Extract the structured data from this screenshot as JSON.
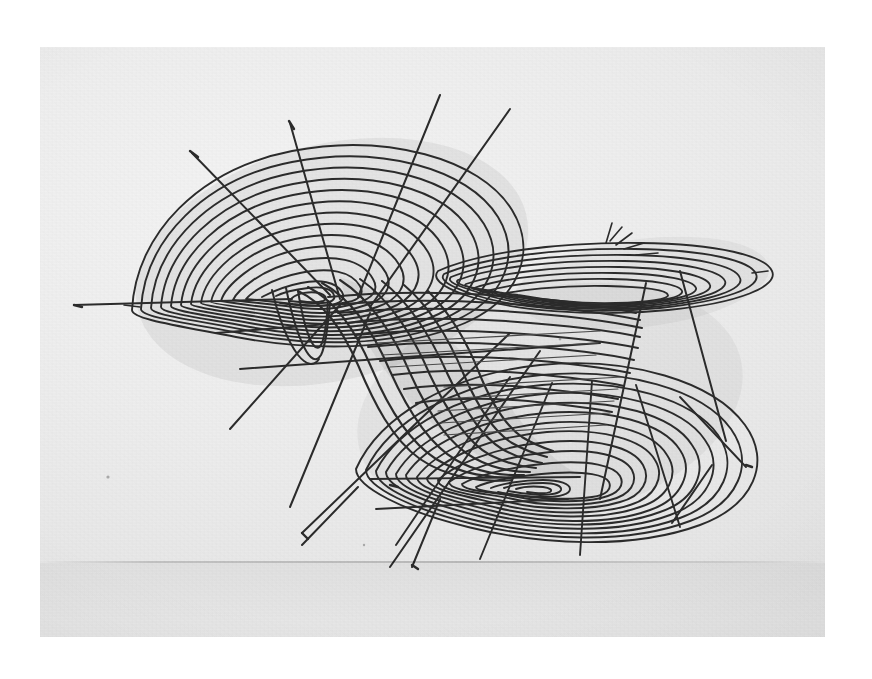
{
  "photo": {
    "background_color": "#ffffff",
    "paper_color": "#ededed",
    "ink_color": "#2b2b2b",
    "paper_rect": {
      "x": 40,
      "y": 47,
      "width": 785,
      "height": 590
    },
    "subject": "hand-drawn wireframe of a folded two-lobed surface",
    "caption": ""
  },
  "chart_data": {
    "type": "line",
    "title": "",
    "subtitle": "",
    "xlabel": "",
    "ylabel": "",
    "grid": false,
    "legend": "none",
    "structures": [
      {
        "name": "upper-left lobe",
        "role": "nested level curves around a local extremum",
        "center": [
          330,
          262
        ],
        "contour_count": 12,
        "outer_semi_axes": [
          205,
          120
        ],
        "tilt_deg": -14
      },
      {
        "name": "lower-right lobe",
        "role": "nested level curves around a second local extremum",
        "center": [
          548,
          404
        ],
        "contour_count": 12,
        "outer_semi_axes": [
          200,
          118
        ],
        "tilt_deg": -13
      },
      {
        "name": "upper-right flap",
        "role": "overhanging sheet seen nearly edge-on",
        "center": [
          640,
          283
        ],
        "contour_count": 8,
        "outer_semi_axes": [
          130,
          46
        ],
        "tilt_deg": -7
      },
      {
        "name": "central fold",
        "role": "twisted crease joining the two sheets",
        "from": [
          318,
          268
        ],
        "to": [
          586,
          420
        ]
      }
    ],
    "meridians": {
      "count": 9,
      "description": "straight radial grid lines drawn across both contour families"
    },
    "x": [],
    "values": []
  }
}
